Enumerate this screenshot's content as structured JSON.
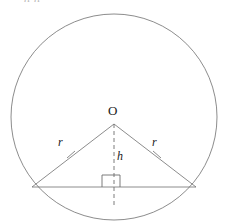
{
  "figure": {
    "clipped_top_text": "nn",
    "background_color": "#ffffff",
    "stroke_color": "#6e6e6e",
    "label_color": "#1a1a1a",
    "labels": {
      "center": "O",
      "radius_left": "r",
      "radius_right": "r",
      "height": "h"
    },
    "geometry": {
      "circle": {
        "cx": 114,
        "cy": 117,
        "r": 103
      },
      "apex": {
        "x": 114,
        "y": 124
      },
      "chord_left": {
        "x": 32,
        "y": 187
      },
      "chord_right": {
        "x": 196,
        "y": 187
      },
      "foot": {
        "x": 114,
        "y": 187
      },
      "dashed_line": {
        "x": 114,
        "y1": 124,
        "y2": 206
      },
      "right_angle_square": {
        "x": 102,
        "y": 175,
        "size": 12
      },
      "tick_left": {
        "x": 71,
        "y": 155
      },
      "tick_right": {
        "x": 157,
        "y": 155
      }
    }
  }
}
